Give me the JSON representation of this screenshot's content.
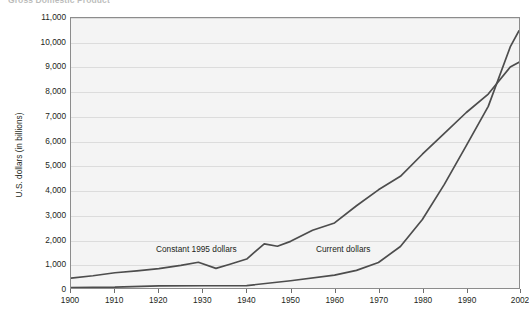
{
  "chart_data": {
    "type": "line",
    "title": "Gross Domestic Product",
    "xlabel": "",
    "ylabel": "U.S. dollars (in billions)",
    "xlim": [
      1900,
      2002
    ],
    "ylim": [
      0,
      11000
    ],
    "grid": true,
    "legend_position": "inline-annotations",
    "y_ticks": [
      0,
      1000,
      2000,
      3000,
      4000,
      5000,
      6000,
      7000,
      8000,
      9000,
      10000,
      11000
    ],
    "y_tick_labels": [
      "0",
      "1,000",
      "2,000",
      "3,000",
      "4,000",
      "5,000",
      "6,000",
      "7,000",
      "8,000",
      "9,000",
      "10,000",
      "11,000"
    ],
    "x_ticks": [
      1900,
      1910,
      1920,
      1930,
      1940,
      1950,
      1960,
      1970,
      1980,
      1990,
      2002
    ],
    "x_tick_labels": [
      "1900",
      "1910",
      "1920",
      "1930",
      "1940",
      "1950",
      "1960",
      "1970",
      "1980",
      "1990",
      "2002"
    ],
    "series": [
      {
        "name": "Constant 1995 dollars",
        "color": "#4d4d4d",
        "x": [
          1900,
          1905,
          1910,
          1915,
          1920,
          1925,
          1929,
          1933,
          1936,
          1940,
          1944,
          1947,
          1950,
          1955,
          1960,
          1965,
          1970,
          1975,
          1980,
          1985,
          1990,
          1995,
          2000,
          2002
        ],
        "values": [
          400,
          500,
          620,
          700,
          790,
          920,
          1050,
          800,
          960,
          1180,
          1800,
          1700,
          1900,
          2350,
          2650,
          3350,
          4000,
          4550,
          5450,
          6300,
          7150,
          7900,
          9000,
          9200
        ]
      },
      {
        "name": "Current dollars",
        "color": "#4d4d4d",
        "x": [
          1900,
          1910,
          1920,
          1930,
          1940,
          1950,
          1960,
          1965,
          1970,
          1975,
          1980,
          1985,
          1990,
          1995,
          2000,
          2002
        ],
        "values": [
          20,
          35,
          90,
          92,
          100,
          294,
          527,
          720,
          1040,
          1690,
          2790,
          4220,
          5800,
          7400,
          9820,
          10480
        ]
      }
    ],
    "annotations": [
      {
        "text": "Constant 1995 dollars",
        "x": 1930,
        "y": 1350
      },
      {
        "text": "Current dollars",
        "x": 1966,
        "y": 1350
      }
    ]
  }
}
